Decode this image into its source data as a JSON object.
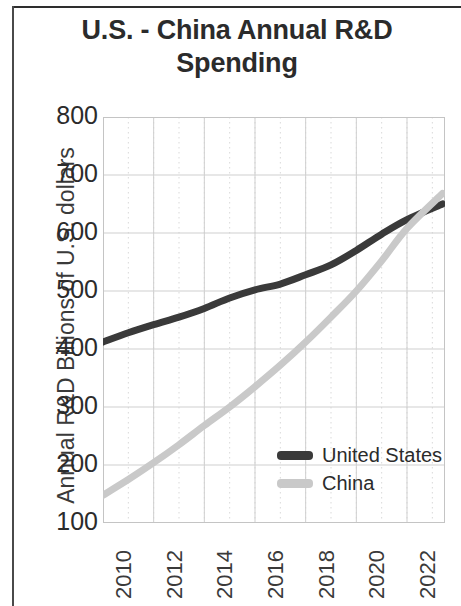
{
  "chart_data": {
    "type": "line",
    "title": "U.S. - China Annual R&D Spending",
    "xlabel": "",
    "ylabel": "Annual R&D Billions of U.S. dollars",
    "xlim": [
      2010,
      2023.5
    ],
    "ylim": [
      100,
      800
    ],
    "ytick_labels": [
      "800",
      "700",
      "600",
      "500",
      "400",
      "300",
      "200",
      "100"
    ],
    "ytick_values": [
      800,
      700,
      600,
      500,
      400,
      300,
      200,
      100
    ],
    "xtick_labels": [
      "2010",
      "2012",
      "2014",
      "2016",
      "2018",
      "2020",
      "2022"
    ],
    "xtick_values": [
      2010,
      2012,
      2014,
      2016,
      2018,
      2020,
      2022
    ],
    "grid": true,
    "grid_minor": true,
    "legend_position": "lower right",
    "x": [
      2010,
      2011,
      2012,
      2013,
      2014,
      2015,
      2016,
      2017,
      2018,
      2019,
      2020,
      2021,
      2022,
      2023.4
    ],
    "series": [
      {
        "name": "United States",
        "color": "#3a3a3a",
        "values": [
          412,
          428,
          442,
          455,
          470,
          488,
          502,
          512,
          528,
          545,
          570,
          598,
          623,
          650
        ]
      },
      {
        "name": "China",
        "color": "#c9c9c9",
        "values": [
          148,
          175,
          204,
          235,
          268,
          300,
          335,
          372,
          412,
          455,
          500,
          552,
          608,
          668
        ]
      }
    ]
  },
  "legend": {
    "entries": [
      {
        "label": "United States",
        "color": "#3a3a3a"
      },
      {
        "label": "China",
        "color": "#c9c9c9"
      }
    ]
  }
}
